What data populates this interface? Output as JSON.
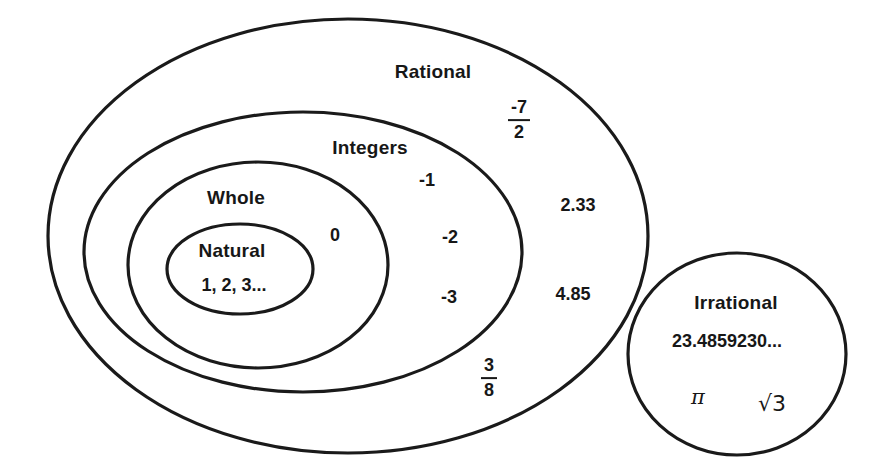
{
  "diagram": {
    "type": "euler-venn-diagram",
    "stroke_color": "#1a1a1a",
    "text_color": "#171717",
    "background_color": "#ffffff"
  },
  "sets": {
    "rational": {
      "label": "Rational",
      "members": [
        "-7/2",
        "2.33",
        "4.85",
        "3/8"
      ]
    },
    "integers": {
      "label": "Integers",
      "members": [
        "-1",
        "-2",
        "-3"
      ]
    },
    "whole": {
      "label": "Whole",
      "members": [
        "0"
      ]
    },
    "natural": {
      "label": "Natural",
      "members": [
        "1, 2, 3..."
      ]
    },
    "irrational": {
      "label": "Irrational",
      "members": [
        "23.4859230...",
        "π",
        "√3"
      ]
    }
  },
  "labels": {
    "rational_name": "Rational",
    "integers_name": "Integers",
    "whole_name": "Whole",
    "natural_name": "Natural",
    "natural_members": "1, 2, 3...",
    "irrational_name": "Irrational",
    "irrational_decimal": "23.4859230...",
    "irrational_pi": "π",
    "irrational_sqrt3": "√3",
    "zero": "0",
    "neg_one": "-1",
    "neg_two": "-2",
    "neg_three": "-3",
    "dec_233": "2.33",
    "dec_485": "4.85",
    "frac_neg7_num": "-7",
    "frac_neg7_den": "2",
    "frac_38_num": "3",
    "frac_38_den": "8"
  }
}
